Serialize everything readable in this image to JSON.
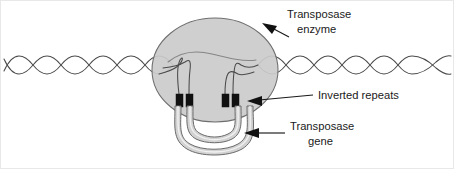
{
  "figure": {
    "background_color": "#ffffff"
  },
  "colors": {
    "enzyme_fill": "#cbcbcb",
    "enzyme_stroke": "#6e6e6e",
    "dna_stroke": "#4a4a4a",
    "repeat_fill": "#111111",
    "loop_fill": "#d2d2d2",
    "label_color": "#1a1a1a",
    "frame_color": "#e8e8e8"
  },
  "labels": [
    {
      "id": "transposase-enzyme",
      "line1": "Transposase",
      "line2": "enzyme",
      "arrow": "arrow-down-left"
    },
    {
      "id": "inverted-repeats",
      "line1": "Inverted repeats",
      "line2": "",
      "arrow": "arrow-left"
    },
    {
      "id": "transposase-gene",
      "line1": "Transposase",
      "line2": "gene",
      "arrow": "arrow-left"
    }
  ],
  "structures": {
    "dna_label": "double-helix-dna-strand",
    "enzyme_label": "transposase-enzyme-blob",
    "loop_label": "transposase-gene-loop",
    "repeat_blocks_count": 4,
    "repeat_pairs": 2
  }
}
